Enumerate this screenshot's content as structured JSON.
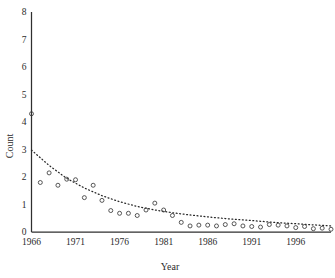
{
  "chart_data": {
    "type": "scatter",
    "title": "",
    "xlabel": "Year",
    "ylabel": "Count",
    "xlim": [
      1966,
      2000
    ],
    "ylim": [
      0,
      8
    ],
    "grid": false,
    "legend": null,
    "xticks": [
      1966,
      1971,
      1976,
      1981,
      1986,
      1991,
      1996
    ],
    "xtick_labels": [
      "1966",
      "1971",
      "1976",
      "1981",
      "1986",
      "1991",
      "1996"
    ],
    "yticks": [
      0,
      1,
      2,
      3,
      4,
      5,
      6,
      7,
      8
    ],
    "ytick_labels": [
      "0",
      "1",
      "2",
      "3",
      "4",
      "5",
      "6",
      "7",
      "8"
    ],
    "marker_style": "open-circle",
    "series": [
      {
        "name": "Count",
        "x": [
          1966,
          1967,
          1968,
          1969,
          1970,
          1971,
          1972,
          1973,
          1974,
          1975,
          1976,
          1977,
          1978,
          1979,
          1980,
          1981,
          1982,
          1983,
          1984,
          1985,
          1986,
          1987,
          1988,
          1989,
          1990,
          1991,
          1992,
          1993,
          1994,
          1995,
          1996,
          1997,
          1998,
          1999,
          2000
        ],
        "y": [
          4.3,
          1.8,
          2.15,
          1.7,
          1.92,
          1.9,
          1.25,
          1.7,
          1.15,
          0.78,
          0.68,
          0.68,
          0.6,
          0.8,
          1.05,
          0.8,
          0.6,
          0.35,
          0.22,
          0.25,
          0.25,
          0.22,
          0.27,
          0.3,
          0.22,
          0.2,
          0.18,
          0.27,
          0.25,
          0.22,
          0.16,
          0.2,
          0.12,
          0.14,
          0.1
        ]
      }
    ],
    "trendline": {
      "style": "dotted",
      "description": "exponential decay fit",
      "x": [
        1966,
        1968,
        1970,
        1972,
        1974,
        1976,
        1978,
        1980,
        1982,
        1984,
        1986,
        1988,
        1990,
        1992,
        1994,
        1996,
        1998,
        2000
      ],
      "y": [
        2.98,
        2.42,
        1.95,
        1.6,
        1.32,
        1.1,
        0.93,
        0.8,
        0.7,
        0.62,
        0.55,
        0.49,
        0.44,
        0.39,
        0.34,
        0.3,
        0.26,
        0.22
      ]
    }
  },
  "axes": {
    "y_title": "Count",
    "x_title": "Year"
  }
}
